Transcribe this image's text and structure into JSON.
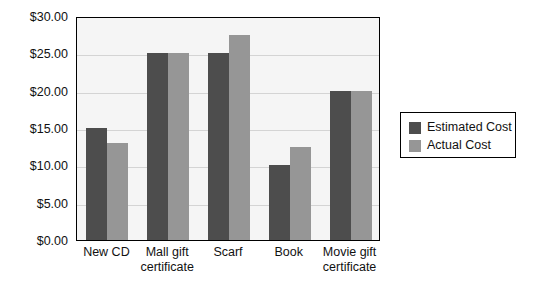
{
  "chart_data": {
    "type": "bar",
    "title": "",
    "subtitle": "",
    "xlabel": "",
    "ylabel": "",
    "categories": [
      "New CD",
      "Mall gift certificate",
      "Scarf",
      "Book",
      "Movie gift certificate"
    ],
    "series": [
      {
        "name": "Estimated Cost",
        "color": "#4d4d4d",
        "values": [
          15.0,
          25.0,
          25.0,
          10.0,
          20.0
        ]
      },
      {
        "name": "Actual Cost",
        "color": "#969696",
        "values": [
          13.0,
          25.0,
          27.5,
          12.5,
          20.0
        ]
      }
    ],
    "ylim": [
      0,
      30
    ],
    "y_ticks": [
      0,
      5,
      10,
      15,
      20,
      25,
      30
    ],
    "y_tick_labels": [
      "$0.00",
      "$5.00",
      "$10.00",
      "$15.00",
      "$20.00",
      "$25.00",
      "$30.00"
    ],
    "grid": true,
    "legend_position": "right",
    "legend_entries": [
      "Estimated Cost",
      "Actual Cost"
    ],
    "annotations": []
  },
  "legend": {
    "items": [
      {
        "label": "Estimated Cost"
      },
      {
        "label": "Actual Cost"
      }
    ]
  }
}
